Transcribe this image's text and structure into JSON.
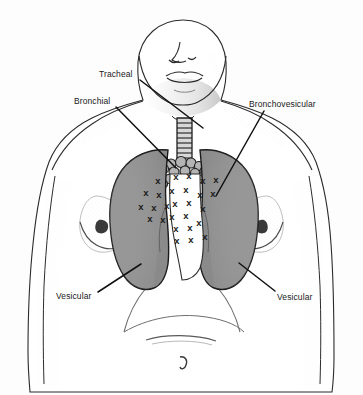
{
  "figure": {
    "background_color": "#fdfdfd",
    "width": 363,
    "height": 395
  },
  "colors": {
    "lung_fill": "#8a8a8a",
    "lung_outline": "#1a1a1a",
    "body_outline": "#2b2b2b",
    "skin_fill": "#ffffff",
    "stipple": "#9a9a9a",
    "leader_line": "#111111",
    "marker": "#1a1a1a",
    "label_text": "#1a1a1a"
  },
  "labels": [
    {
      "id": "tracheal",
      "text": "Tracheal",
      "x": 99,
      "y": 69,
      "leader": {
        "x1": 140,
        "y1": 80,
        "x2": 203,
        "y2": 128
      }
    },
    {
      "id": "bronchial",
      "text": "Bronchial",
      "x": 74,
      "y": 96,
      "leader": {
        "x1": 116,
        "y1": 107,
        "x2": 176,
        "y2": 168
      }
    },
    {
      "id": "bronchovesicular",
      "text": "Bronchovesicular",
      "x": 249,
      "y": 99,
      "leader": {
        "x1": 264,
        "y1": 111,
        "x2": 216,
        "y2": 196
      }
    },
    {
      "id": "vesicular-left",
      "text": "Vesicular",
      "x": 56,
      "y": 291,
      "leader": {
        "x1": 98,
        "y1": 292,
        "x2": 141,
        "y2": 264
      }
    },
    {
      "id": "vesicular-right",
      "text": "Vesicular",
      "x": 277,
      "y": 292,
      "leader": {
        "x1": 275,
        "y1": 291,
        "x2": 239,
        "y2": 263
      }
    }
  ],
  "anatomy": {
    "head_and_neck": "anterior view of head, neck and chin",
    "trachea": {
      "segments": 9,
      "description": "segmented tracheal cartilage rings"
    },
    "bronchi": {
      "description": "cluster of bronchial branches at carina"
    },
    "left_lung": {
      "label": "patient right lung (viewer left)",
      "fill": "#8a8a8a"
    },
    "right_lung": {
      "label": "patient left lung (viewer right)",
      "fill": "#8a8a8a"
    },
    "breasts": 2,
    "umbilicus": 1,
    "ribcage_margin": "costal margin arcs over the abdomen"
  },
  "markers": {
    "glyph": "x",
    "count": 27,
    "description": "x marks indicating bronchovesicular auscultation sites flanking the sternum",
    "positions": [
      {
        "x": 158,
        "y": 184
      },
      {
        "x": 146,
        "y": 196
      },
      {
        "x": 159,
        "y": 198
      },
      {
        "x": 141,
        "y": 210
      },
      {
        "x": 154,
        "y": 211
      },
      {
        "x": 167,
        "y": 209
      },
      {
        "x": 150,
        "y": 222
      },
      {
        "x": 163,
        "y": 223
      },
      {
        "x": 176,
        "y": 180
      },
      {
        "x": 189,
        "y": 179
      },
      {
        "x": 172,
        "y": 194
      },
      {
        "x": 186,
        "y": 193
      },
      {
        "x": 175,
        "y": 207
      },
      {
        "x": 189,
        "y": 206
      },
      {
        "x": 172,
        "y": 220
      },
      {
        "x": 186,
        "y": 219
      },
      {
        "x": 176,
        "y": 232
      },
      {
        "x": 190,
        "y": 231
      },
      {
        "x": 177,
        "y": 244
      },
      {
        "x": 191,
        "y": 243
      },
      {
        "x": 203,
        "y": 184
      },
      {
        "x": 216,
        "y": 183
      },
      {
        "x": 200,
        "y": 198
      },
      {
        "x": 213,
        "y": 197
      },
      {
        "x": 203,
        "y": 212
      },
      {
        "x": 199,
        "y": 226
      },
      {
        "x": 205,
        "y": 240
      }
    ]
  }
}
